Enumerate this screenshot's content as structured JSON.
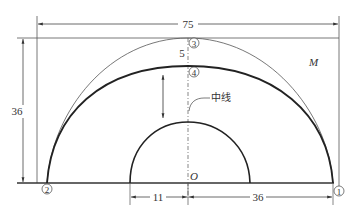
{
  "diagram": {
    "type": "technical-drawing",
    "dimensions": {
      "total_width": "75",
      "height": "36",
      "gap_top": "5",
      "inner_radius": "11",
      "outer_offset": "36"
    },
    "labels": {
      "region": "M",
      "origin": "O",
      "center_line": "中线"
    },
    "points": [
      {
        "id": "p1",
        "label": "①"
      },
      {
        "id": "p2",
        "label": "②"
      },
      {
        "id": "p3",
        "label": "③"
      },
      {
        "id": "p4",
        "label": "④"
      }
    ],
    "colors": {
      "line": "#333333",
      "thin_line": "#666666",
      "background": "#ffffff"
    }
  }
}
